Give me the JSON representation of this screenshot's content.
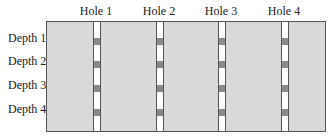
{
  "diagram": {
    "holes": [
      {
        "label": "Hole 1"
      },
      {
        "label": "Hole 2"
      },
      {
        "label": "Hole 3"
      },
      {
        "label": "Hole 4"
      }
    ],
    "depths": [
      {
        "label": "Depth 1"
      },
      {
        "label": "Depth 2"
      },
      {
        "label": "Depth 3"
      },
      {
        "label": "Depth 4"
      }
    ],
    "colors": {
      "ground": "#d9d9d9",
      "hole": "#ffffff",
      "sample_block": "#8a8a8a",
      "outline": "#555555"
    }
  }
}
